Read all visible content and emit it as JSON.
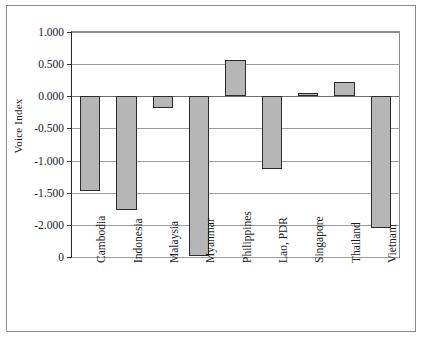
{
  "chart_data": {
    "type": "bar",
    "title": "",
    "subtitle": "",
    "xlabel": "",
    "ylabel": "Voice Index",
    "categories": [
      "Cambodia",
      "Indonesia",
      "Malaysia",
      "Myanmar",
      "Philippines",
      "Lao, PDR",
      "Singapore",
      "Thailand",
      "Vietnam"
    ],
    "values": [
      -1.48,
      -1.77,
      -0.19,
      -2.48,
      0.56,
      -1.13,
      0.05,
      0.22,
      -2.05
    ],
    "series": [
      {
        "name": "Voice Index",
        "values": [
          -1.48,
          -1.77,
          -0.19,
          -2.48,
          0.56,
          -1.13,
          0.05,
          0.22,
          -2.05
        ]
      }
    ],
    "ylim": [
      -2.5,
      1.0
    ],
    "ytick_values": [
      1.0,
      0.5,
      0.0,
      -0.5,
      -1.0,
      -1.5,
      -2.0,
      -2.5
    ],
    "ytick_labels": [
      "1.000",
      "0.500",
      "0.000",
      "-0.500",
      "-1.000",
      "-1.500",
      "-2.000",
      "0"
    ],
    "grid": true,
    "legend": false,
    "legend_position": "none",
    "bar_fill_color": "#b6b6b6",
    "bar_edge_color": "#2b2b2b",
    "gridline_color": "#9a9a9a",
    "axis_color": "#2a2a2a",
    "frame_color": "#8d8d8d",
    "background_color": "#ffffff"
  }
}
